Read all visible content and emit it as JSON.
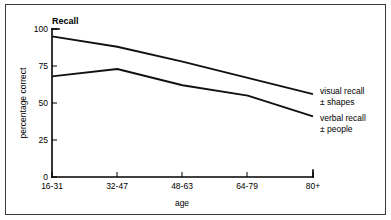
{
  "chart_data": {
    "type": "line",
    "title": "Recall",
    "xlabel": "age",
    "ylabel": "percentage correct",
    "categories": [
      "16-31",
      "32-47",
      "48-63",
      "64-79",
      "80+"
    ],
    "ylim": [
      0,
      100
    ],
    "yticks": [
      0,
      25,
      50,
      75,
      100
    ],
    "ytick_labels": [
      "0",
      "25",
      "50",
      "75",
      "100"
    ],
    "grid": false,
    "legend_position": "right-inline",
    "series": [
      {
        "name": "visual recall ± shapes",
        "label_line1": "visual recall",
        "label_line2": "± shapes",
        "values": [
          95,
          88,
          78,
          67,
          56
        ],
        "color": "#111111"
      },
      {
        "name": "verbal recall ± people",
        "label_line1": "verbal recall",
        "label_line2": "± people",
        "values": [
          68,
          73,
          62,
          55,
          41
        ],
        "color": "#111111"
      }
    ]
  },
  "figure": {
    "title": "Recall",
    "xlabel": "age",
    "ylabel": "percentage correct",
    "ytick_0": "0",
    "ytick_1": "25",
    "ytick_2": "50",
    "ytick_3": "75",
    "ytick_4": "100",
    "xtick_0": "16-31",
    "xtick_1": "32-47",
    "xtick_2": "48-63",
    "xtick_3": "64-79",
    "xtick_4": "80+",
    "series0_label1": "visual recall",
    "series0_label2": "± shapes",
    "series1_label1": "verbal recall",
    "series1_label2": "± people",
    "border_color": "#3a3a3a",
    "line_color": "#111111",
    "background": "#ffffff"
  }
}
